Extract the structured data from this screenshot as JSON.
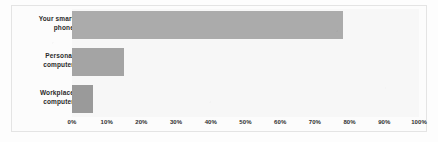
{
  "chart_data": {
    "type": "bar",
    "orientation": "horizontal",
    "title": "",
    "xlabel": "",
    "ylabel": "",
    "categories": [
      "Your smart phone",
      "Personal computer",
      "Workplace computer"
    ],
    "category_lines": [
      [
        "Your smart",
        "phone"
      ],
      [
        "Personal",
        "computer"
      ],
      [
        "Workplace",
        "computer"
      ]
    ],
    "values": [
      78,
      15,
      6
    ],
    "xlim": [
      0,
      100
    ],
    "xtick_labels": [
      "0%",
      "10%",
      "20%",
      "30%",
      "40%",
      "50%",
      "60%",
      "70%",
      "80%",
      "90%",
      "100%"
    ],
    "xtick_values": [
      0,
      10,
      20,
      30,
      40,
      50,
      60,
      70,
      80,
      90,
      100
    ],
    "grid": false,
    "legend": false,
    "bar_colors": [
      "#ababab",
      "#a4a4a4",
      "#9a9a9a"
    ],
    "plot_background": "#f7f7f7",
    "frame_color": "#e4e4e4"
  },
  "ghost_text": {
    "line_a": "lity of SM",
    "line_b": "gain in reporting and data on",
    "line_c": "are also used in the course of",
    "line_d": "scanned artifact"
  }
}
